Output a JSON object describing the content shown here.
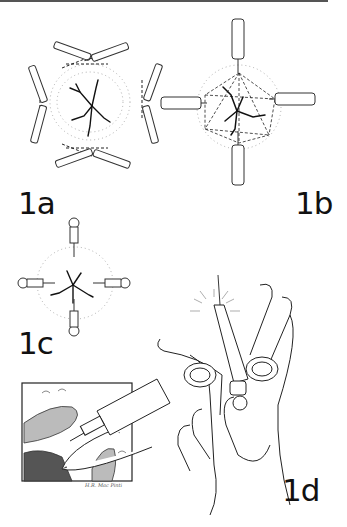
{
  "figure": {
    "panels": [
      {
        "id": "1a",
        "label": "1a",
        "description": "Four needle pairs converging at cross points outside a stellate lesion, dashed injection paths"
      },
      {
        "id": "1b",
        "label": "1b",
        "description": "Four needles at cardinal points with dashed lines radiating into a stellate lesion"
      },
      {
        "id": "1c",
        "label": "1c",
        "description": "Four small needles pointing toward the center of a stellate lesion"
      },
      {
        "id": "1d",
        "label": "1d",
        "description": "Hand holding a ring-handled syringe with needle inserted into tissue"
      }
    ],
    "inset": {
      "description": "Cross-section of tissue with syringe and finger"
    },
    "signature": "H.R. Mac Pinti",
    "colors": {
      "ink": "#111111",
      "stipple": "#9a9a9a",
      "rule": "#555555",
      "background": "#ffffff"
    }
  }
}
